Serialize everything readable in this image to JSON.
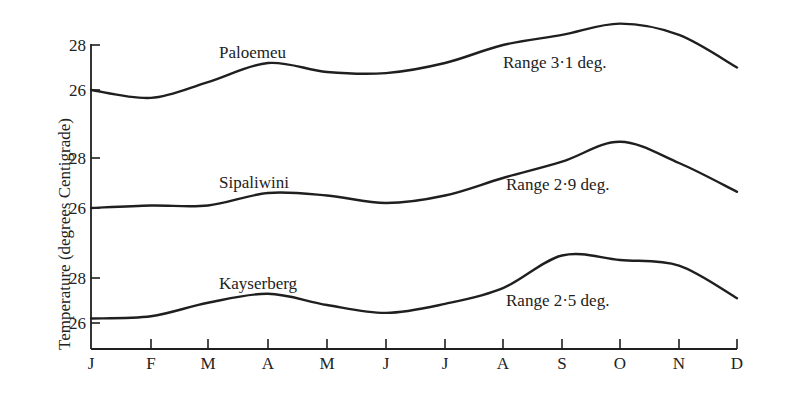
{
  "chart_data": {
    "type": "line",
    "title": "",
    "xlabel": "",
    "ylabel": "Temperature (degrees Centigrade)",
    "categories": [
      "J",
      "F",
      "M",
      "A",
      "M",
      "J",
      "J",
      "A",
      "S",
      "O",
      "N",
      "D"
    ],
    "grid": false,
    "legend": "none (direct line labels)",
    "series": [
      {
        "name": "Paloemeu",
        "annotation": "Range 3·1 deg.",
        "yticks": [
          26,
          28
        ],
        "values": [
          26.0,
          25.65,
          26.35,
          27.2,
          26.8,
          26.75,
          27.2,
          28.0,
          28.45,
          28.95,
          28.45,
          27.0
        ]
      },
      {
        "name": "Sipaliwini",
        "annotation": "Range 2·9 deg.",
        "yticks": [
          26,
          28
        ],
        "values": [
          26.0,
          26.1,
          26.1,
          26.6,
          26.5,
          26.2,
          26.5,
          27.2,
          27.85,
          28.65,
          27.8,
          26.65
        ]
      },
      {
        "name": "Kayserberg",
        "annotation": "Range 2·5 deg.",
        "yticks": [
          26,
          28
        ],
        "values": [
          26.2,
          26.3,
          26.9,
          27.3,
          26.8,
          26.45,
          26.85,
          27.55,
          29.0,
          28.8,
          28.55,
          27.1
        ]
      }
    ]
  },
  "axis": {
    "ylabel": "Temperature (degrees Centigrade)",
    "months": [
      "J",
      "F",
      "M",
      "A",
      "M",
      "J",
      "J",
      "A",
      "S",
      "O",
      "N",
      "D"
    ],
    "tick_26": "26",
    "tick_28": "28"
  },
  "stations": [
    {
      "name": "Paloemeu",
      "range": "Range 3·1 deg."
    },
    {
      "name": "Sipaliwini",
      "range": "Range 2·9 deg."
    },
    {
      "name": "Kayserberg",
      "range": "Range 2·5 deg."
    }
  ],
  "colors": {
    "ink": "#1f1f1f",
    "background": "#ffffff"
  }
}
